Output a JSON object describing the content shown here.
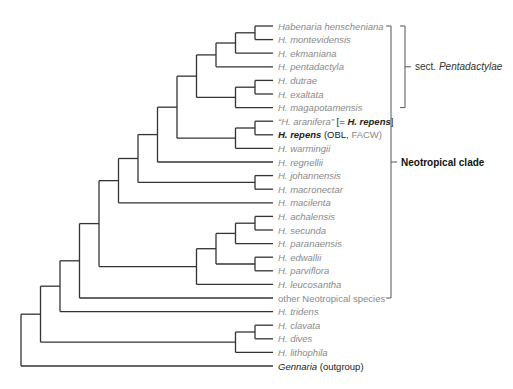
{
  "figure": {
    "type": "phylogenetic-tree",
    "leaves": [
      {
        "id": "henscheniana",
        "parts": [
          {
            "text": "Habenaria henscheniana"
          }
        ]
      },
      {
        "id": "montevidensis",
        "parts": [
          {
            "text": "H. montevidensis"
          }
        ]
      },
      {
        "id": "ekmaniana",
        "parts": [
          {
            "text": "H. ekmaniana"
          }
        ]
      },
      {
        "id": "pentadactyla",
        "parts": [
          {
            "text": "H. pentadactyla"
          }
        ]
      },
      {
        "id": "dutrae",
        "parts": [
          {
            "text": "H. dutrae"
          }
        ]
      },
      {
        "id": "exaltata",
        "parts": [
          {
            "text": "H. exaltata"
          }
        ]
      },
      {
        "id": "magapotamensis",
        "parts": [
          {
            "text": "H. magapotamensis"
          }
        ]
      },
      {
        "id": "aranifera",
        "parts": [
          {
            "text": "“H. aranifera” "
          },
          {
            "text": "[= ",
            "style": "dark upright"
          },
          {
            "text": "H. repens",
            "style": "dark bold"
          },
          {
            "text": "]",
            "style": "dark upright"
          }
        ]
      },
      {
        "id": "repens",
        "parts": [
          {
            "text": "H. repens",
            "style": "dark bold"
          },
          {
            "text": " (OBL, ",
            "style": "dark upright"
          },
          {
            "text": "FACW)",
            "style": "upright"
          }
        ]
      },
      {
        "id": "warmingii",
        "parts": [
          {
            "text": "H. warmingii"
          }
        ]
      },
      {
        "id": "regnellii",
        "parts": [
          {
            "text": "H. regnellii"
          }
        ]
      },
      {
        "id": "johannensis",
        "parts": [
          {
            "text": "H. johannensis"
          }
        ]
      },
      {
        "id": "macronectar",
        "parts": [
          {
            "text": "H. macronectar"
          }
        ]
      },
      {
        "id": "macilenta",
        "parts": [
          {
            "text": "H. macilenta"
          }
        ]
      },
      {
        "id": "achalensis",
        "parts": [
          {
            "text": "H. achalensis"
          }
        ]
      },
      {
        "id": "secunda",
        "parts": [
          {
            "text": "H. secunda"
          }
        ]
      },
      {
        "id": "paranaensis",
        "parts": [
          {
            "text": "H. paranaensis"
          }
        ]
      },
      {
        "id": "edwallii",
        "parts": [
          {
            "text": "H. edwallii"
          }
        ]
      },
      {
        "id": "parviflora",
        "parts": [
          {
            "text": "H. parviflora"
          }
        ]
      },
      {
        "id": "leucosantha",
        "parts": [
          {
            "text": "H. leucosantha"
          }
        ]
      },
      {
        "id": "other",
        "parts": [
          {
            "text": "other Neotropical species",
            "style": "upright"
          }
        ]
      },
      {
        "id": "tridens",
        "parts": [
          {
            "text": "H. tridens"
          }
        ]
      },
      {
        "id": "clavata",
        "parts": [
          {
            "text": "H. clavata"
          }
        ]
      },
      {
        "id": "dives",
        "parts": [
          {
            "text": "H. dives"
          }
        ]
      },
      {
        "id": "lithophila",
        "parts": [
          {
            "text": "H. lithophila"
          }
        ]
      },
      {
        "id": "gennaria",
        "parts": [
          {
            "text": "Gennaria",
            "style": "dark"
          },
          {
            "text": " (outgroup)",
            "style": "dark upright"
          }
        ]
      }
    ],
    "topology": [
      "root",
      [
        [
          [
            [
              [
                [
                  [
                    [
                      [
                        [
                          [
                            [
                              [
                                "henscheniana",
                                "montevidensis"
                              ],
                              "ekmaniana"
                            ],
                            "pentadactyla"
                          ],
                          [
                            [
                              "dutrae",
                              "exaltata"
                            ],
                            "magapotamensis"
                          ]
                        ],
                        [
                          [
                            "aranifera",
                            "repens"
                          ],
                          "warmingii"
                        ]
                      ],
                      "regnellii"
                    ],
                    [
                      "johannensis",
                      "macronectar"
                    ]
                  ],
                  "macilenta"
                ],
                [
                  [
                    [
                      [
                        "achalensis",
                        "secunda"
                      ],
                      "paranaensis"
                    ],
                    [
                      "edwallii",
                      "parviflora"
                    ]
                  ],
                  "leucosantha"
                ]
              ],
              "other"
            ],
            "tridens"
          ],
          [
            [
              "clavata",
              "dives"
            ],
            "lithophila"
          ]
        ],
        "gennaria"
      ]
    ],
    "clades": [
      {
        "id": "pentadactylae",
        "label_prefix": "sect. ",
        "label_italic": "Pentadactylae",
        "from": "henscheniana",
        "to": "magapotamensis"
      },
      {
        "id": "neotropical",
        "label": "Neotropical clade",
        "from": "henscheniana",
        "to": "other"
      }
    ]
  }
}
